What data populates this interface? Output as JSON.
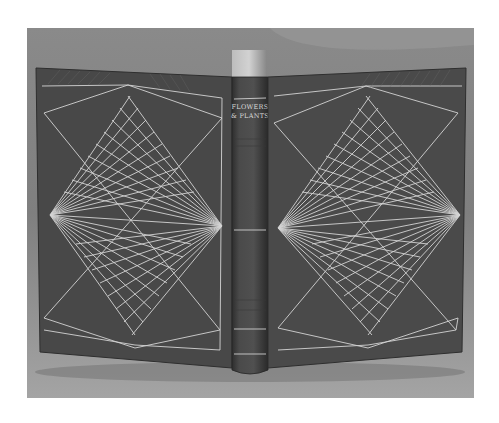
{
  "photo": {
    "subject": "fine leather bookbinding, open flat showing front board, spine and back board",
    "colors": {
      "page_background": "#ffffff",
      "backdrop_top": "#8e8e8e",
      "backdrop_bottom": "#a2a2a2",
      "leather": "#4a4a4a",
      "leather_dark": "#3a3a3a",
      "gilt_line": "#d6d6d6",
      "page_edges": "#c4c4c4"
    }
  },
  "book": {
    "spine": {
      "title_line_1": "FLOWERS",
      "title_line_2": "& PLANTS"
    }
  }
}
